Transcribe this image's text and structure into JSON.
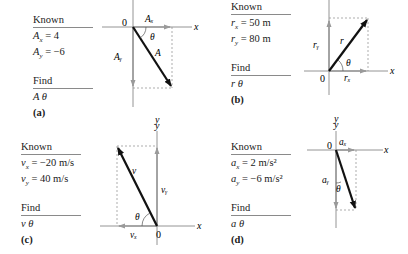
{
  "panels": [
    {
      "id": "a",
      "label": "(a)",
      "known_header": "Known",
      "known": [
        "Aₓ = 4",
        "Aᵧ = −6"
      ],
      "known_lines": [
        {
          "sym": "A",
          "sub": "x",
          "rest": " = 4"
        },
        {
          "sym": "A",
          "sub": "y",
          "rest": " = −6"
        }
      ],
      "find_header": "Find",
      "find": "A   θ",
      "vector": {
        "name": "A",
        "x_comp": "Aₓ",
        "y_comp": "Aᵧ",
        "angle": "θ"
      },
      "origin_label": "0",
      "x_axis_label": "x",
      "y_axis_label": "y"
    },
    {
      "id": "b",
      "label": "(b)",
      "known_header": "Known",
      "known_lines": [
        {
          "sym": "r",
          "sub": "x",
          "rest": " = 50 m"
        },
        {
          "sym": "r",
          "sub": "y",
          "rest": " = 80 m"
        }
      ],
      "find_header": "Find",
      "find": "r   θ",
      "vector": {
        "name": "r",
        "x_comp": "rₓ",
        "y_comp": "rᵧ",
        "angle": "θ"
      },
      "origin_label": "0",
      "x_axis_label": "x",
      "y_axis_label": "y"
    },
    {
      "id": "c",
      "label": "(c)",
      "known_header": "Known",
      "known_lines": [
        {
          "sym": "v",
          "sub": "x",
          "rest": " = −20 m/s"
        },
        {
          "sym": "v",
          "sub": "y",
          "rest": " = 40 m/s"
        }
      ],
      "find_header": "Find",
      "find": "v   θ",
      "vector": {
        "name": "v",
        "x_comp": "vₓ",
        "y_comp": "vᵧ",
        "angle": "θ"
      },
      "origin_label": "0",
      "x_axis_label": "x",
      "y_axis_label": "y"
    },
    {
      "id": "d",
      "label": "(d)",
      "known_header": "Known",
      "known_lines": [
        {
          "sym": "a",
          "sub": "x",
          "rest": " = 2 m/s²"
        },
        {
          "sym": "a",
          "sub": "y",
          "rest": " = −6 m/s²"
        }
      ],
      "find_header": "Find",
      "find": "a   θ",
      "vector": {
        "name": "a",
        "x_comp": "aₓ",
        "y_comp": "aᵧ",
        "angle": "θ"
      },
      "origin_label": "0",
      "x_axis_label": "x",
      "y_axis_label": "y"
    }
  ],
  "colors": {
    "axis": "#7a7a7a",
    "component": "#9a9a9a",
    "resultant": "#111111",
    "dashed": "#8a8a8a",
    "text": "#1a1a1a"
  }
}
